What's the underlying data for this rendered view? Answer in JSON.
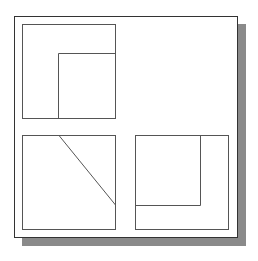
{
  "diagram": {
    "colors": {
      "frame_border": "#333333",
      "shadow": "#8a8a8a",
      "panel_stroke": "#555555",
      "background": "#ffffff"
    },
    "panels": [
      {
        "id": "top-left",
        "x": 22,
        "y": 24,
        "w": 93,
        "h": 94,
        "inner": {
          "type": "corner-L",
          "x": 58,
          "y": 53
        }
      },
      {
        "id": "bottom-left",
        "x": 22,
        "y": 135,
        "w": 93,
        "h": 94,
        "inner": {
          "type": "diagonal",
          "x1": 59,
          "y1": 135,
          "x2": 115,
          "y2": 205
        }
      },
      {
        "id": "bottom-right",
        "x": 135,
        "y": 135,
        "w": 93,
        "h": 94,
        "inner": {
          "type": "corner-L",
          "x": 200,
          "y": 205
        }
      }
    ]
  }
}
